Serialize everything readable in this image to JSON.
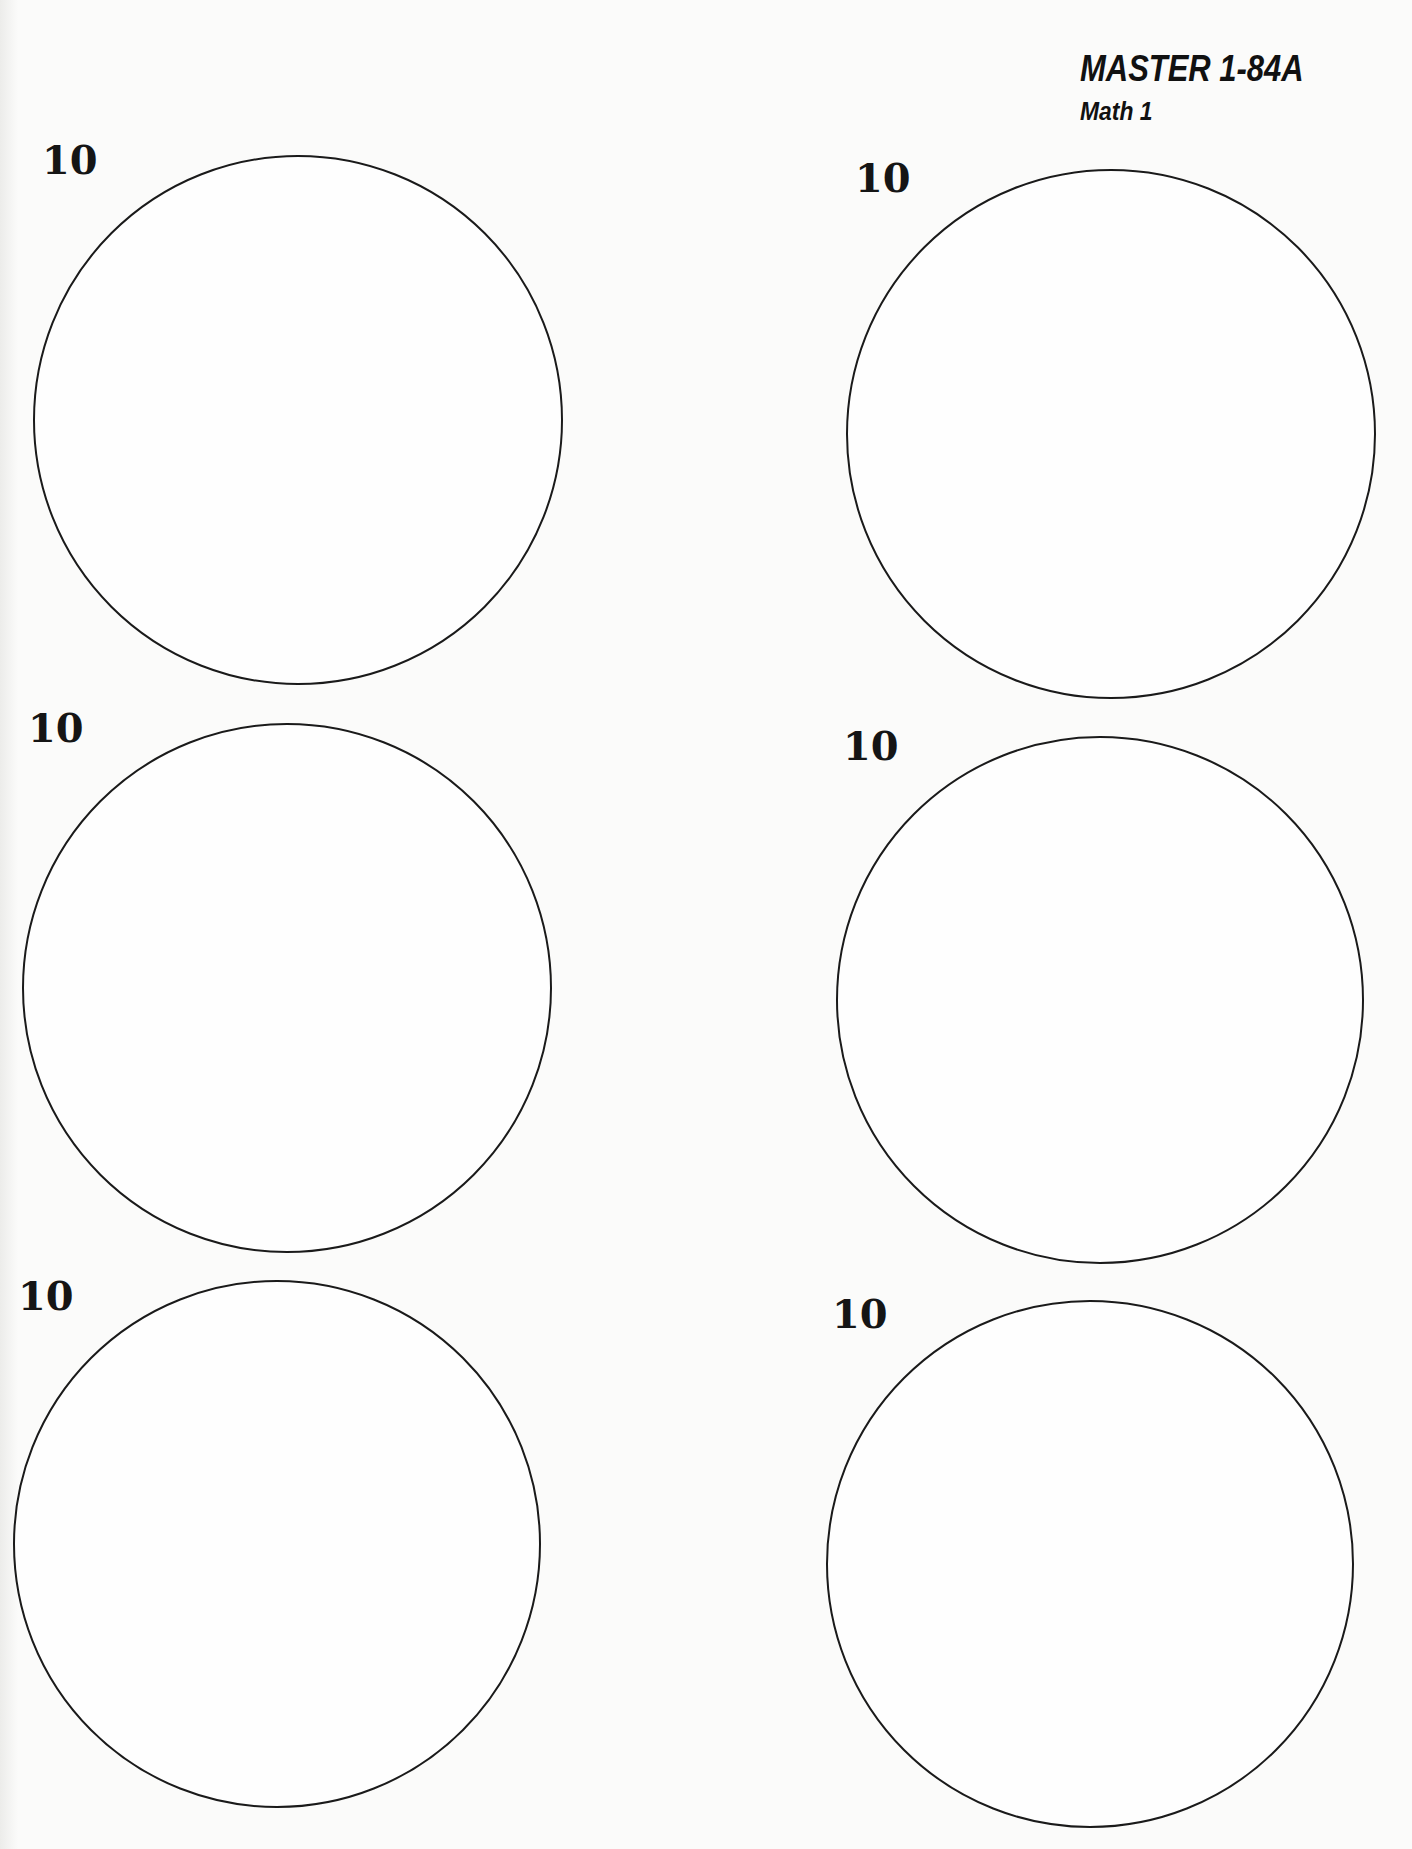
{
  "header": {
    "master": "MASTER 1-84A",
    "subject": "Math 1"
  },
  "circles": [
    {
      "label": "10",
      "cx": 298,
      "cy": 420,
      "r": 265,
      "label_x": 42,
      "label_y": 140
    },
    {
      "label": "10",
      "cx": 1111,
      "cy": 434,
      "r": 265,
      "label_x": 855,
      "label_y": 158
    },
    {
      "label": "10",
      "cx": 287,
      "cy": 988,
      "r": 265,
      "label_x": 28,
      "label_y": 708
    },
    {
      "label": "10",
      "cx": 1100,
      "cy": 1000,
      "r": 264,
      "label_x": 843,
      "label_y": 726
    },
    {
      "label": "10",
      "cx": 277,
      "cy": 1544,
      "r": 264,
      "label_x": 18,
      "label_y": 1276
    },
    {
      "label": "10",
      "cx": 1090,
      "cy": 1564,
      "r": 264,
      "label_x": 832,
      "label_y": 1294
    }
  ]
}
